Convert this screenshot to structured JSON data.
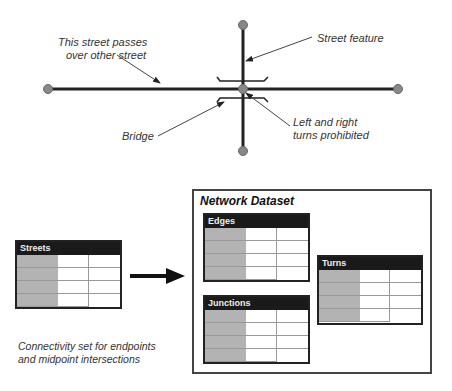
{
  "annotations": {
    "passes_over": [
      "This street passes",
      "over other street"
    ],
    "street_feature": "Street feature",
    "bridge": "Bridge",
    "turns": [
      "Left and right",
      "turns prohibited"
    ],
    "connectivity": [
      "Connectivity set for endpoints",
      "and midpoint intersections"
    ]
  },
  "tables": {
    "streets": {
      "title": "Streets",
      "rows": 4
    },
    "edges": {
      "title": "Edges",
      "rows": 4
    },
    "junctions": {
      "title": "Junctions",
      "rows": 4
    },
    "turns": {
      "title": "Turns",
      "rows": 4
    }
  },
  "network_dataset": {
    "title": "Network Dataset"
  },
  "colors": {
    "line": "#222222",
    "node": "#888888",
    "id_column": "#b3b3b3",
    "header": "#1a1a1a"
  }
}
